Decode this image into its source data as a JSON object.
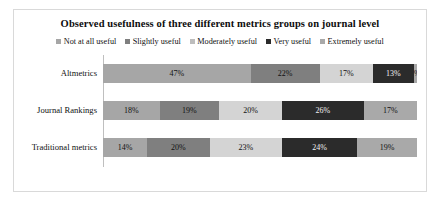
{
  "chart_data": {
    "type": "bar",
    "subtype": "stacked-horizontal-100-percent",
    "title": "Observed usefulness of three different metrics groups on journal level",
    "xlabel": "",
    "ylabel": "",
    "categories": [
      "Altmetrics",
      "Journal Rankings",
      "Traditional metrics"
    ],
    "series": [
      {
        "name": "Not at all useful",
        "color": "#a6a6a6",
        "values": [
          47,
          18,
          14
        ],
        "labels": [
          "47%",
          "18%",
          "14%"
        ]
      },
      {
        "name": "Slightly useful",
        "color": "#7f7f7f",
        "values": [
          22,
          19,
          20
        ],
        "labels": [
          "22%",
          "19%",
          "20%"
        ]
      },
      {
        "name": "Moderately useful",
        "color": "#d4d4d4",
        "values": [
          17,
          20,
          23
        ],
        "labels": [
          "17%",
          "20%",
          "23%"
        ]
      },
      {
        "name": "Very useful",
        "color": "#2b2b2b",
        "values": [
          13,
          26,
          24
        ],
        "labels": [
          "13%",
          "26%",
          "24%"
        ]
      },
      {
        "name": "Extremely useful",
        "color": "#a9a9a9",
        "values": [
          1,
          17,
          19
        ],
        "labels": [
          "1%",
          "17%",
          "19%"
        ]
      }
    ],
    "xlim": [
      0,
      100
    ],
    "grid": false,
    "legend_position": "top",
    "label_colors": {
      "on_light": "#111111",
      "on_dark": "#f2f2f2"
    },
    "frame_color": "#d9d9d9",
    "axis_color": "#bfbfbf"
  }
}
